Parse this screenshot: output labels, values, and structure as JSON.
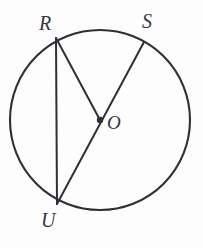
{
  "figure": {
    "kind": "circle-geometry-diagram",
    "canvas": {
      "width": 203,
      "height": 248
    },
    "background_color": "#fdfdfd",
    "stroke_color": "#2f2f36",
    "label_color": "#36363e",
    "circle": {
      "name": "circle-O",
      "center_label": "O",
      "cx": 100,
      "cy": 120,
      "r": 90,
      "stroke_width": 2.1
    },
    "center_dot": {
      "name": "center-point-O",
      "cx": 100,
      "cy": 120,
      "r": 3.2
    },
    "points": [
      {
        "id": "R",
        "label": "R",
        "x": 56,
        "y": 38,
        "label_x": 39,
        "label_y": 13
      },
      {
        "id": "S",
        "label": "S",
        "x": 144,
        "y": 42,
        "label_x": 142,
        "label_y": 11
      },
      {
        "id": "O",
        "label": "O",
        "x": 100,
        "y": 120,
        "label_x": 107,
        "label_y": 113
      },
      {
        "id": "U",
        "label": "U",
        "x": 57,
        "y": 204,
        "label_x": 41,
        "label_y": 210
      }
    ],
    "segments": [
      {
        "id": "RU",
        "name": "chord-RU",
        "from": "R",
        "to": "U",
        "x1": 56,
        "y1": 38,
        "x2": 57,
        "y2": 204,
        "kind": "chord"
      },
      {
        "id": "RO",
        "name": "radius-RO",
        "from": "R",
        "to": "O",
        "x1": 56,
        "y1": 38,
        "x2": 100,
        "y2": 120,
        "kind": "radius"
      },
      {
        "id": "SU",
        "name": "diameter-SU",
        "from": "S",
        "to": "U",
        "x1": 144,
        "y1": 42,
        "x2": 57,
        "y2": 204,
        "kind": "diameter"
      }
    ],
    "labels": {
      "R": "R",
      "S": "S",
      "O": "O",
      "U": "U"
    }
  }
}
